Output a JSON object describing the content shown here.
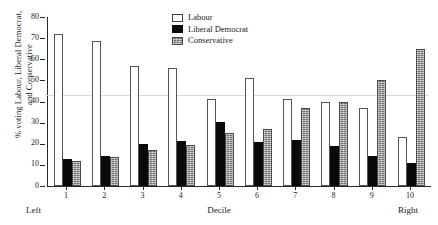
{
  "chart_data": {
    "type": "bar",
    "title": "",
    "subtitle": "",
    "xlabel": "Decile",
    "ylabel": "% voting Labour, Liberal Democrat,\nand Conservative",
    "categories": [
      "1",
      "2",
      "3",
      "4",
      "5",
      "6",
      "7",
      "8",
      "9",
      "10"
    ],
    "ylim": [
      0,
      80
    ],
    "yticks": [
      0,
      10,
      20,
      30,
      40,
      50,
      60,
      70,
      80
    ],
    "grid": false,
    "reference_line": 43,
    "legend_position": "top-center",
    "series": [
      {
        "name": "Labour",
        "style": "open-white",
        "color": "#ffffff",
        "values": [
          72,
          68.5,
          57,
          56,
          41,
          51,
          41,
          40,
          37,
          23
        ]
      },
      {
        "name": "Liberal Democrat",
        "style": "solid-black",
        "color": "#0a0a0a",
        "values": [
          13,
          14,
          20,
          21.5,
          30.5,
          21,
          22,
          19,
          14,
          11
        ]
      },
      {
        "name": "Conservative",
        "style": "hatched-gray",
        "color": "#6e6e6e",
        "values": [
          12,
          13.5,
          17,
          19.5,
          25,
          27,
          37,
          40,
          50,
          65
        ]
      }
    ],
    "axis_annotations": {
      "left": "Left",
      "right": "Right"
    }
  },
  "legend": {
    "items": [
      {
        "label": "Labour"
      },
      {
        "label": "Liberal Democrat"
      },
      {
        "label": "Conservative"
      }
    ]
  }
}
